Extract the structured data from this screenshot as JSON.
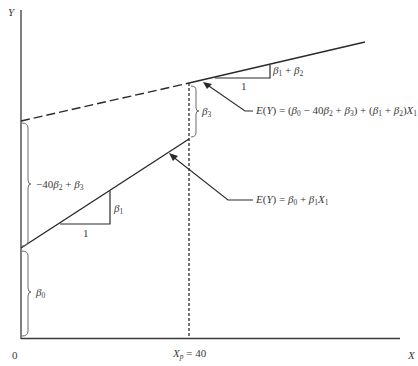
{
  "axes": {
    "y_label": "Y",
    "x_label": "X",
    "origin_label": "0",
    "xp_label": "X",
    "xp_sub": "p",
    "xp_value": " = 40"
  },
  "lines": {
    "upper": {
      "equation_prefix": "E(Y) = (β",
      "equation_text": "E(Y) = (β0 − 40β2 + β3) + (β1 + β2)X1",
      "slope_label": "β1 + β2",
      "run_label": "1"
    },
    "lower": {
      "equation_text": "E(Y) = β0 + β1X1",
      "slope_label": "β1",
      "run_label": "1"
    }
  },
  "braces": {
    "intercept": "β0",
    "intercept_shift": "−40β2 + β3",
    "jump": "β3"
  },
  "colors": {
    "line": "#2a2a2a",
    "brace": "#6a6a6a",
    "text": "#3a3a3a"
  }
}
